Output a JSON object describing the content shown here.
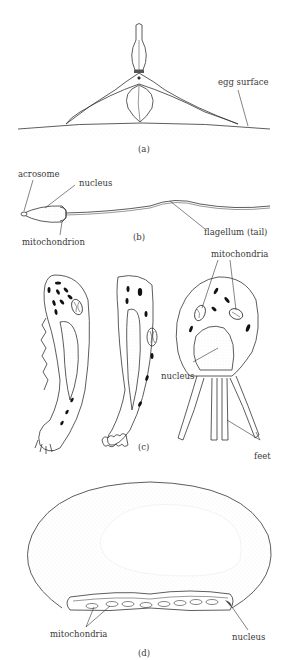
{
  "figure": {
    "panels": [
      {
        "id": "a",
        "caption": "(a)",
        "labels": [
          "egg surface"
        ]
      },
      {
        "id": "b",
        "caption": "(b)",
        "labels": [
          "acrosome",
          "nucleus",
          "mitochondrion",
          "flagellum (tail)"
        ]
      },
      {
        "id": "c",
        "caption": "(c)",
        "labels": [
          "mitochondria",
          "nucleus",
          "feet"
        ]
      },
      {
        "id": "d",
        "caption": "(d)",
        "labels": [
          "mitochondria",
          "nucleus"
        ]
      }
    ]
  }
}
